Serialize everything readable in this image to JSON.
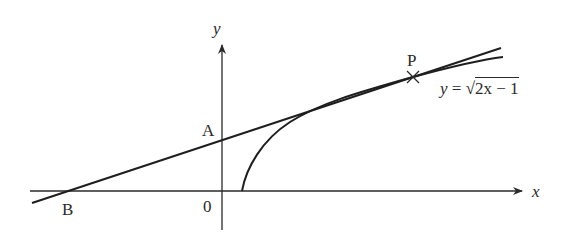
{
  "figure": {
    "type": "tangent-to-curve diagram",
    "curve_equation": {
      "lhs": "y",
      "equals": "=",
      "radical": "√",
      "radicand": "2x − 1"
    },
    "axes": {
      "x_label": "x",
      "y_label": "y",
      "origin_label": "0"
    },
    "points": [
      {
        "name": "A",
        "description": "tangent line meets y-axis"
      },
      {
        "name": "B",
        "description": "tangent line meets x-axis"
      },
      {
        "name": "P",
        "description": "point of tangency on curve",
        "marker": "×"
      }
    ],
    "colors": {
      "ink": "#2a2a2a",
      "background": "#ffffff"
    }
  }
}
